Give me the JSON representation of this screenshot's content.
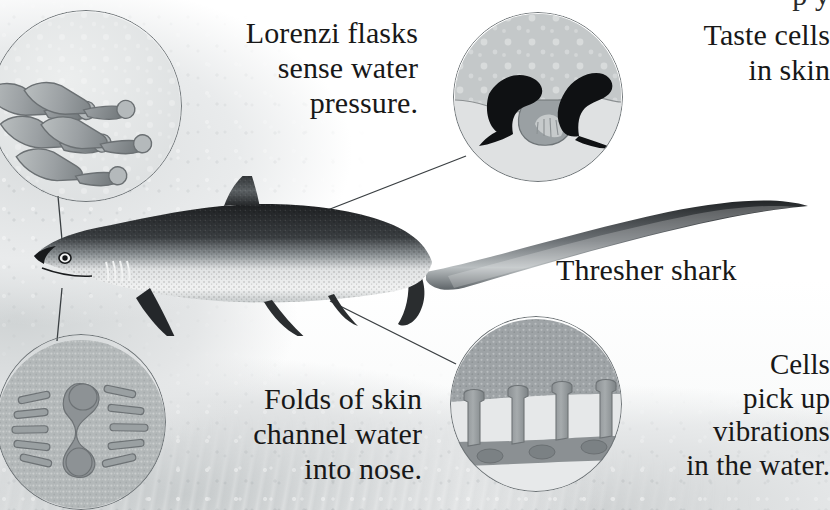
{
  "diagram": {
    "subject_label": "Thresher shark",
    "background": {
      "scene": "underwater",
      "paper_color": "#ffffff",
      "water_tint": "#d9dcdd"
    },
    "palette": {
      "ink": "#181818",
      "line": "#3a3f42",
      "inset_ring": "#6f7578",
      "inset_fill_light": "#d2d5d6",
      "inset_fill_mid": "#9aa0a3",
      "inset_fill_dark": "#7e8589",
      "shark_dark": "#2c2f31",
      "shark_light": "#e8e9ea"
    }
  },
  "captions": {
    "clipped_top": "p y",
    "lorenzi": "Lorenzi flasks\nsense water\npressure.",
    "taste": "Taste cells\nin skin",
    "thresher": "Thresher shark",
    "folds": "Folds of skin\nchannel water\ninto nose.",
    "cells": "Cells\npick up\nvibrations\nin the water."
  },
  "insets": [
    {
      "id": "lorenzi-flasks",
      "name": "ampullae-of-lorenzini-inset",
      "caption_key": "lorenzi",
      "center": {
        "x": 86,
        "y": 106
      },
      "radius": 96,
      "depicts": "cluster of flask-shaped jelly-filled pores angled through the skin"
    },
    {
      "id": "taste-cells",
      "name": "taste-cells-inset",
      "caption_key": "taste",
      "center": {
        "x": 538,
        "y": 97
      },
      "radius": 85,
      "depicts": "two dark taste bud cells flanking a pale sensory papilla below a speckled skin surface"
    },
    {
      "id": "skin-folds",
      "name": "nasal-skin-folds-inset",
      "caption_key": "folds",
      "center": {
        "x": 81,
        "y": 422
      },
      "radius": 85,
      "depicts": "nostril opening flanked by rows of angled skin folds that channel water"
    },
    {
      "id": "lateral-line-cells",
      "name": "lateral-line-cells-inset",
      "caption_key": "cells",
      "center": {
        "x": 536,
        "y": 404
      },
      "radius": 86,
      "depicts": "cross-section of skin canal with column cells that detect vibrations"
    }
  ],
  "leader_lines": [
    {
      "name": "leader-lorenzi-to-snout",
      "from": {
        "x": 58,
        "y": 196
      },
      "to": {
        "x": 62,
        "y": 258
      }
    },
    {
      "name": "leader-folds-to-snout",
      "from": {
        "x": 60,
        "y": 286
      },
      "to": {
        "x": 58,
        "y": 340
      }
    },
    {
      "name": "leader-taste-to-flank",
      "from": {
        "x": 465,
        "y": 155
      },
      "to": {
        "x": 286,
        "y": 226
      }
    },
    {
      "name": "leader-cells-to-flank",
      "from": {
        "x": 457,
        "y": 363
      },
      "to": {
        "x": 330,
        "y": 302
      }
    }
  ],
  "shark": {
    "name": "thresher-shark-illustration",
    "style": "engraved stipple halftone",
    "features": [
      "dorsal fin",
      "pectoral fin",
      "pelvic fin",
      "gill slits",
      "eye",
      "elongated upper caudal lobe"
    ]
  }
}
